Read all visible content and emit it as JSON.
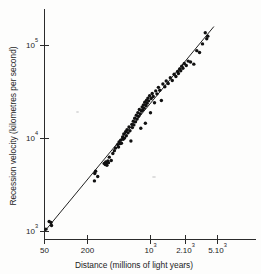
{
  "figure": {
    "kind": "hubble-diagram",
    "background_color": "#fdfdfc",
    "ink_color": "#1a1a1a"
  },
  "chart_data": {
    "type": "scatter",
    "title": "",
    "subtitle": "",
    "xlabel": "Distance (millions of light years)",
    "ylabel": "Recession velocity (kilometres per second)",
    "xscale": "log",
    "yscale": "log",
    "xlim": [
      50,
      6000
    ],
    "ylim": [
      900,
      210000
    ],
    "grid": false,
    "legend": null,
    "x_tick_labels": [
      "50",
      "200",
      "10³",
      "2.10³",
      "5.10³"
    ],
    "x_tick_values": [
      50,
      200,
      1000,
      2000,
      5000
    ],
    "y_tick_labels": [
      "10³",
      "10⁴",
      "10⁵"
    ],
    "y_tick_values": [
      1000,
      10000,
      100000
    ],
    "x_tick_label_parts": [
      {
        "base": "50",
        "exp": ""
      },
      {
        "base": "200",
        "exp": ""
      },
      {
        "base": "10",
        "exp": "3"
      },
      {
        "base": "2.10",
        "exp": "3"
      },
      {
        "base": "5.10",
        "exp": "3"
      }
    ],
    "y_tick_label_parts": [
      {
        "base": "10",
        "exp": "3"
      },
      {
        "base": "10",
        "exp": "4"
      },
      {
        "base": "10",
        "exp": "5"
      }
    ],
    "fit_line": {
      "name": "Hubble law best fit",
      "x_start": 50,
      "y_start": 1000,
      "x_end": 6000,
      "y_end": 160000,
      "slope_loglog": 1.0,
      "color": "#222222"
    },
    "marker": {
      "shape": "circle",
      "color": "#111111",
      "radius_px": 1.7
    },
    "points": [
      [
        52,
        1060
      ],
      [
        57,
        1280
      ],
      [
        60,
        1250
      ],
      [
        61,
        1160
      ],
      [
        205,
        3500
      ],
      [
        207,
        4200
      ],
      [
        212,
        4450
      ],
      [
        225,
        3900
      ],
      [
        270,
        5400
      ],
      [
        278,
        5250
      ],
      [
        282,
        5600
      ],
      [
        288,
        5500
      ],
      [
        292,
        5150
      ],
      [
        300,
        5750
      ],
      [
        305,
        5500
      ],
      [
        312,
        6300
      ],
      [
        330,
        5800
      ],
      [
        345,
        6900
      ],
      [
        360,
        7400
      ],
      [
        372,
        7900
      ],
      [
        395,
        8600
      ],
      [
        405,
        8100
      ],
      [
        412,
        9200
      ],
      [
        420,
        8800
      ],
      [
        430,
        9600
      ],
      [
        440,
        8900
      ],
      [
        455,
        10400
      ],
      [
        462,
        9800
      ],
      [
        470,
        11200
      ],
      [
        480,
        10100
      ],
      [
        495,
        11800
      ],
      [
        505,
        10700
      ],
      [
        515,
        12400
      ],
      [
        530,
        11500
      ],
      [
        545,
        13300
      ],
      [
        560,
        12100
      ],
      [
        575,
        9400
      ],
      [
        590,
        14200
      ],
      [
        600,
        13100
      ],
      [
        615,
        15300
      ],
      [
        625,
        14000
      ],
      [
        640,
        16500
      ],
      [
        655,
        15100
      ],
      [
        670,
        17800
      ],
      [
        685,
        16200
      ],
      [
        700,
        19000
      ],
      [
        715,
        17300
      ],
      [
        730,
        20500
      ],
      [
        745,
        18400
      ],
      [
        760,
        12900
      ],
      [
        775,
        19700
      ],
      [
        790,
        21800
      ],
      [
        800,
        20300
      ],
      [
        820,
        23000
      ],
      [
        835,
        21200
      ],
      [
        850,
        24500
      ],
      [
        865,
        14600
      ],
      [
        880,
        22600
      ],
      [
        895,
        25800
      ],
      [
        910,
        24000
      ],
      [
        930,
        27200
      ],
      [
        950,
        25400
      ],
      [
        975,
        28800
      ],
      [
        1000,
        18900
      ],
      [
        1020,
        26900
      ],
      [
        1050,
        30500
      ],
      [
        1080,
        28300
      ],
      [
        1120,
        24200
      ],
      [
        1160,
        32500
      ],
      [
        1200,
        30200
      ],
      [
        1250,
        35500
      ],
      [
        1300,
        33000
      ],
      [
        1360,
        25600
      ],
      [
        1420,
        38500
      ],
      [
        1500,
        36000
      ],
      [
        1560,
        41500
      ],
      [
        1650,
        39000
      ],
      [
        1750,
        45000
      ],
      [
        1850,
        42000
      ],
      [
        1950,
        49000
      ],
      [
        2050,
        46500
      ],
      [
        2150,
        52500
      ],
      [
        2200,
        50000
      ],
      [
        2280,
        56000
      ],
      [
        2350,
        53500
      ],
      [
        2420,
        60000
      ],
      [
        2500,
        57000
      ],
      [
        2600,
        64000
      ],
      [
        2750,
        61000
      ],
      [
        2900,
        68000
      ],
      [
        3100,
        66500
      ],
      [
        3400,
        63000
      ],
      [
        3700,
        88000
      ],
      [
        4000,
        84000
      ],
      [
        4350,
        104000
      ],
      [
        4700,
        137000
      ],
      [
        4900,
        118000
      ],
      [
        5050,
        126000
      ]
    ],
    "n_points": 99
  }
}
